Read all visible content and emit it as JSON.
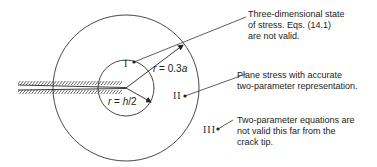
{
  "diagram": {
    "type": "crack-tip-stress-zones",
    "zones": [
      {
        "id": "I",
        "label": "I",
        "note_lines": [
          "Three-dimensional state",
          "of stress.  Eqs. (14.1)",
          "are not valid."
        ]
      },
      {
        "id": "II",
        "label": "II",
        "note_lines": [
          "Plane stress with accurate",
          "two-parameter representation."
        ]
      },
      {
        "id": "III",
        "label": "III",
        "note_lines": [
          "Two-parameter equations are",
          "not valid this far from the",
          "crack tip."
        ]
      }
    ],
    "radii": {
      "outer": {
        "var": "r",
        "eq": " = 0.3",
        "sym": "a"
      },
      "inner": {
        "var": "r",
        "eq": " = ",
        "sym": "h",
        "tail": "/2"
      }
    },
    "colors": {
      "line": "#333333",
      "text": "#222222",
      "background": "#ffffff"
    }
  }
}
